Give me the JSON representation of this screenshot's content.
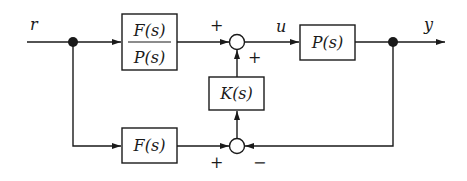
{
  "diagram": {
    "type": "block-diagram",
    "signals": {
      "input": "r",
      "control": "u",
      "output": "y"
    },
    "blocks": {
      "feedforward": {
        "numerator": "F(s)",
        "denominator": "P(s)"
      },
      "plant": "P(s)",
      "controller": "K(s)",
      "reference_filter": "F(s)"
    },
    "summing_junctions": {
      "top": {
        "left_sign": "+",
        "bottom_sign": "+"
      },
      "bottom": {
        "left_sign": "+",
        "right_sign": "−"
      }
    },
    "colors": {
      "line": "#1a1a1a",
      "background": "#ffffff"
    }
  }
}
